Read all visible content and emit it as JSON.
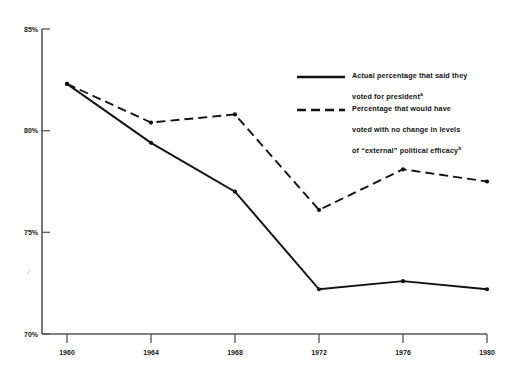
{
  "chart_data": {
    "type": "line",
    "title": "",
    "xlabel": "",
    "ylabel": "",
    "categories": [
      "1960",
      "1964",
      "1968",
      "1972",
      "1976",
      "1980"
    ],
    "x": [
      1960,
      1964,
      1968,
      1972,
      1976,
      1980
    ],
    "xlim": [
      1960,
      1980
    ],
    "ylim": [
      70,
      85
    ],
    "ytick_labels": [
      "85%",
      "80%",
      "75%",
      "70%"
    ],
    "yticks": [
      85,
      80,
      75,
      70
    ],
    "grid": false,
    "legend_position": "upper-right-inside",
    "series": [
      {
        "name": "Actual percentage that said they voted for president",
        "name_superscript": "a",
        "style": "solid",
        "color": "#111111",
        "values": [
          82.3,
          79.4,
          77.0,
          72.2,
          72.6,
          72.2
        ]
      },
      {
        "name": "Percentage that would have voted with no change in levels of \"external\" political efficacy",
        "name_superscript": "b",
        "style": "dashed",
        "color": "#111111",
        "values": [
          82.3,
          80.4,
          80.8,
          76.1,
          78.1,
          77.5
        ]
      }
    ]
  },
  "legend": {
    "entries": [
      {
        "line1": "Actual percentage that said they",
        "line2": "voted for president",
        "superscript": "a",
        "style": "solid",
        "swatch_name": "solid-line-swatch"
      },
      {
        "line1": "Percentage that would have",
        "line2": "voted with no change in levels",
        "line3": "of “external” political efficacy",
        "superscript": "b",
        "style": "dashed",
        "swatch_name": "dashed-line-swatch"
      }
    ]
  },
  "axes": {
    "y_labels": [
      "85%",
      "80%",
      "75%",
      "70%"
    ],
    "x_labels": [
      "1960",
      "1964",
      "1968",
      "1972",
      "1976",
      "1980"
    ],
    "axis_color": "#4a4a4a"
  },
  "artifact": {
    "mark": "⁄"
  }
}
